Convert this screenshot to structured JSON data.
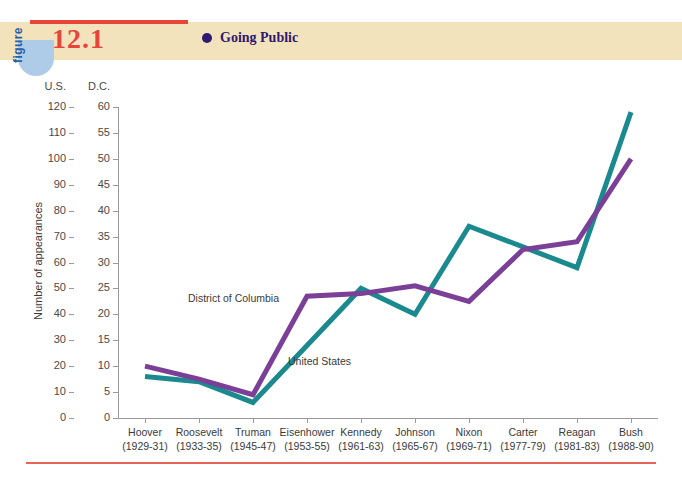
{
  "figure": {
    "tab_word": "figure",
    "number": "12.1",
    "legend_label": "Going Public",
    "legend_bullet_color": "#2e1a6e",
    "band_color": "#f3e3bd",
    "rule_color": "#e8443a"
  },
  "chart_data": {
    "type": "line",
    "title": "Going Public",
    "xlabel": "",
    "ylabel": "Number of appearances",
    "grid": false,
    "legend_position": "inline-annotation",
    "categories": [
      "Hoover",
      "Roosevelt",
      "Truman",
      "Eisenhower",
      "Kennedy",
      "Johnson",
      "Nixon",
      "Carter",
      "Reagan",
      "Bush"
    ],
    "category_years": [
      "(1929-31)",
      "(1933-35)",
      "(1945-47)",
      "(1953-55)",
      "(1961-63)",
      "(1965-67)",
      "(1969-71)",
      "(1977-79)",
      "(1981-83)",
      "(1988-90)"
    ],
    "tick_labels": [
      {
        "president": "Hoover",
        "years": "(1929-31)"
      },
      {
        "president": "Roosevelt",
        "years": "(1933-35)"
      },
      {
        "president": "Truman",
        "years": "(1945-47)"
      },
      {
        "president": "Eisenhower",
        "years": "(1953-55)"
      },
      {
        "president": "Kennedy",
        "years": "(1961-63)"
      },
      {
        "president": "Johnson",
        "years": "(1965-67)"
      },
      {
        "president": "Nixon",
        "years": "(1969-71)"
      },
      {
        "president": "Carter",
        "years": "(1977-79)"
      },
      {
        "president": "Reagan",
        "years": "(1981-83)"
      },
      {
        "president": "Bush",
        "years": "(1988-90)"
      }
    ],
    "axes": {
      "left_primary": {
        "name": "U.S.",
        "label": "U.S.",
        "ylim": [
          0,
          120
        ],
        "tick_step": 10,
        "ticks": [
          0,
          10,
          20,
          30,
          40,
          50,
          60,
          70,
          80,
          90,
          100,
          110,
          120
        ]
      },
      "left_secondary": {
        "name": "D.C.",
        "label": "D.C.",
        "ylim": [
          0,
          60
        ],
        "tick_step": 5,
        "ticks": [
          0,
          5,
          10,
          15,
          20,
          25,
          30,
          35,
          40,
          45,
          50,
          55,
          60
        ]
      }
    },
    "series": [
      {
        "name": "United States",
        "axis": "U.S.",
        "color": "#1a8a8f",
        "annotation": "United States",
        "values": [
          16,
          14,
          6,
          28,
          50,
          40,
          74,
          66,
          58,
          118
        ]
      },
      {
        "name": "District of Columbia",
        "axis": "D.C.",
        "color": "#7b3f98",
        "annotation": "District of Columbia",
        "values": [
          10,
          7.5,
          4.5,
          23.5,
          24,
          25.5,
          22.5,
          32.5,
          34,
          50
        ]
      }
    ]
  }
}
